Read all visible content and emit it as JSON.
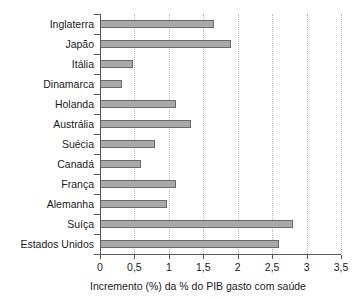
{
  "chart_data": {
    "type": "bar",
    "orientation": "horizontal",
    "title": "",
    "xlabel": "Incremento (%) da % do PIB gasto com saúde",
    "ylabel": "",
    "xlim": [
      0,
      3.5
    ],
    "xticks": [
      0,
      0.5,
      1,
      1.5,
      2,
      2.5,
      3,
      3.5
    ],
    "xtick_labels": [
      "0",
      "0,5",
      "1",
      "1,5",
      "2",
      "2,5",
      "3",
      "3,5"
    ],
    "grid": "vertical-dotted",
    "legend": "none",
    "bar_fill_color": "#a9a9a9",
    "bar_edge_color": "#6b6b6b",
    "categories": [
      "Inglaterra",
      "Japão",
      "Itália",
      "Dinamarca",
      "Holanda",
      "Austrália",
      "Suécia",
      "Canadá",
      "França",
      "Alemanha",
      "Suíça",
      "Estados Unidos"
    ],
    "values": [
      1.65,
      1.9,
      0.48,
      0.32,
      1.1,
      1.32,
      0.8,
      0.6,
      1.1,
      0.98,
      2.8,
      2.6
    ]
  }
}
